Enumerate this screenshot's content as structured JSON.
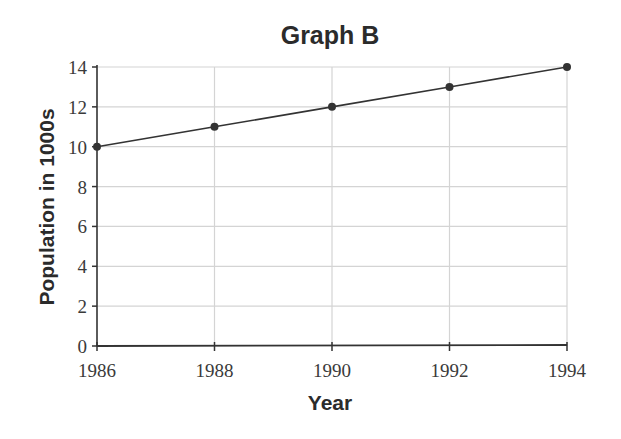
{
  "chart_data": {
    "type": "line",
    "title": "Graph B",
    "xlabel": "Year",
    "ylabel": "Population in 1000s",
    "x": [
      1986,
      1988,
      1990,
      1992,
      1994
    ],
    "series": [
      {
        "name": "Population",
        "values": [
          10,
          11,
          12,
          13,
          14
        ]
      }
    ],
    "x_ticks": [
      "1986",
      "1988",
      "1990",
      "1992",
      "1994"
    ],
    "y_ticks": [
      "0",
      "2",
      "4",
      "6",
      "8",
      "10",
      "12",
      "14"
    ],
    "ylim": [
      0,
      14
    ],
    "xlim": [
      1986,
      1994
    ],
    "grid": true,
    "legend": "none"
  }
}
